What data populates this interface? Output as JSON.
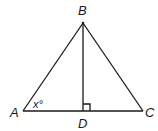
{
  "diagram": {
    "type": "geometry",
    "shape": "triangle with altitude",
    "points": {
      "A": {
        "label": "A",
        "x": 23,
        "y": 111
      },
      "B": {
        "label": "B",
        "x": 83,
        "y": 23
      },
      "C": {
        "label": "C",
        "x": 143,
        "y": 111
      },
      "D": {
        "label": "D",
        "x": 83,
        "y": 111
      }
    },
    "segments": [
      "AB",
      "BC",
      "AC",
      "BD"
    ],
    "right_angle_at": "D",
    "angle_label": "x°",
    "angle_at": "A",
    "line_color": "#1a1a1a"
  }
}
